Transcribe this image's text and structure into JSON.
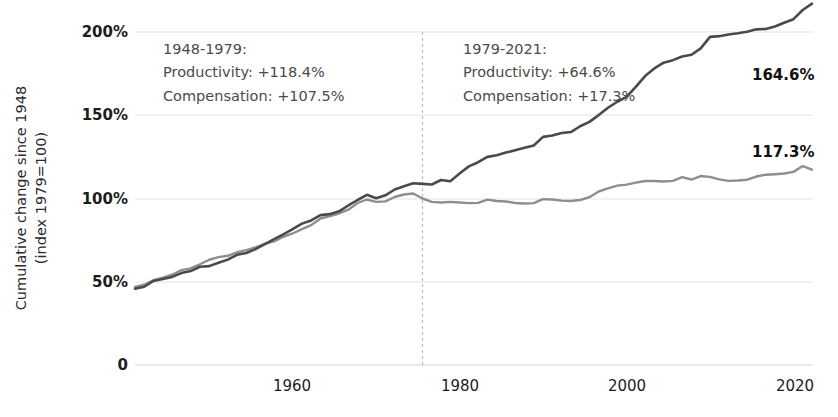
{
  "chart_data": {
    "type": "line",
    "title": "",
    "xlabel": "",
    "ylabel": "Cumulative change since 1948",
    "ylabel_sub": "(index 1979=100)",
    "xlim": [
      1948,
      2021
    ],
    "ylim": [
      0,
      200
    ],
    "grid": true,
    "legend_position": "none",
    "ytick_labels": [
      "200%",
      "150%",
      "100%",
      "50%",
      "0"
    ],
    "ytick_values": [
      200,
      150,
      100,
      50,
      0
    ],
    "xtick_labels": [
      "1960",
      "1980",
      "2000",
      "2020"
    ],
    "xtick_values": [
      1960,
      1980,
      2000,
      2020
    ],
    "reference_line": {
      "x": 1979,
      "style": "dashed",
      "color": "#bbbbbb"
    },
    "series": [
      {
        "name": "Productivity",
        "color": "#4a4a4a",
        "end_label": "164.6%",
        "end_value": 164.6,
        "x": [
          1948,
          1949,
          1950,
          1951,
          1952,
          1953,
          1954,
          1955,
          1956,
          1957,
          1958,
          1959,
          1960,
          1961,
          1962,
          1963,
          1964,
          1965,
          1966,
          1967,
          1968,
          1969,
          1970,
          1971,
          1972,
          1973,
          1974,
          1975,
          1976,
          1977,
          1978,
          1979,
          1980,
          1981,
          1982,
          1983,
          1984,
          1985,
          1986,
          1987,
          1988,
          1989,
          1990,
          1991,
          1992,
          1993,
          1994,
          1995,
          1996,
          1997,
          1998,
          1999,
          2000,
          2001,
          2002,
          2003,
          2004,
          2005,
          2006,
          2007,
          2008,
          2009,
          2010,
          2011,
          2012,
          2013,
          2014,
          2015,
          2016,
          2017,
          2018,
          2019,
          2020,
          2021
        ],
        "values": [
          45.8,
          47.0,
          50.5,
          51.6,
          52.9,
          55.2,
          56.4,
          59.0,
          59.4,
          61.4,
          63.3,
          66.2,
          67.3,
          69.6,
          72.6,
          75.6,
          78.5,
          81.6,
          84.9,
          86.8,
          90.0,
          90.6,
          92.3,
          95.8,
          99.1,
          102.2,
          100.1,
          101.9,
          105.4,
          107.4,
          109.2,
          108.8,
          108.4,
          111.1,
          110.4,
          115.0,
          119.3,
          121.8,
          125.0,
          126.0,
          127.6,
          129.0,
          130.5,
          131.8,
          137.0,
          137.8,
          139.3,
          139.9,
          143.4,
          146.0,
          150.1,
          154.5,
          158.1,
          161.0,
          167.0,
          173.5,
          178.1,
          181.6,
          183.1,
          185.3,
          186.3,
          190.2,
          197.1,
          197.5,
          198.5,
          199.2,
          200.1,
          201.6,
          201.8,
          203.3,
          205.6,
          207.7,
          213.2,
          217.0
        ]
      },
      {
        "name": "Compensation",
        "color": "#8e8e8e",
        "end_label": "117.3%",
        "end_value": 117.3,
        "x": [
          1948,
          1949,
          1950,
          1951,
          1952,
          1953,
          1954,
          1955,
          1956,
          1957,
          1958,
          1959,
          1960,
          1961,
          1962,
          1963,
          1964,
          1965,
          1966,
          1967,
          1968,
          1969,
          1970,
          1971,
          1972,
          1973,
          1974,
          1975,
          1976,
          1977,
          1978,
          1979,
          1980,
          1981,
          1982,
          1983,
          1984,
          1985,
          1986,
          1987,
          1988,
          1989,
          1990,
          1991,
          1992,
          1993,
          1994,
          1995,
          1996,
          1997,
          1998,
          1999,
          2000,
          2001,
          2002,
          2003,
          2004,
          2005,
          2006,
          2007,
          2008,
          2009,
          2010,
          2011,
          2012,
          2013,
          2014,
          2015,
          2016,
          2017,
          2018,
          2019,
          2020,
          2021
        ],
        "values": [
          46.9,
          48.2,
          51.0,
          52.5,
          54.2,
          57.0,
          58.0,
          60.5,
          63.2,
          64.8,
          65.6,
          67.7,
          69.0,
          70.6,
          72.7,
          74.2,
          77.0,
          79.0,
          81.6,
          84.0,
          88.0,
          89.4,
          91.0,
          93.3,
          97.3,
          99.4,
          98.0,
          98.3,
          100.9,
          102.4,
          103.0,
          100.0,
          98.0,
          97.6,
          98.0,
          97.6,
          97.2,
          97.4,
          99.3,
          98.5,
          98.2,
          97.3,
          97.0,
          97.2,
          99.6,
          99.4,
          98.7,
          98.5,
          99.1,
          100.8,
          104.2,
          106.1,
          107.7,
          108.3,
          109.5,
          110.5,
          110.5,
          110.2,
          110.6,
          112.8,
          111.4,
          113.5,
          113.0,
          111.5,
          110.6,
          110.8,
          111.3,
          113.2,
          114.3,
          114.6,
          115.0,
          116.0,
          119.5,
          117.3
        ]
      }
    ],
    "annotations": [
      {
        "id": "period-1948-1979",
        "lines": [
          "1948-1979:",
          "Productivity: +118.4%",
          "Compensation: +107.5%"
        ],
        "period": "1948-1979",
        "productivity_change": "+118.4%",
        "compensation_change": "+107.5%"
      },
      {
        "id": "period-1979-2021",
        "lines": [
          "1979-2021:",
          "Productivity: +64.6%",
          "Compensation: +17.3%"
        ],
        "period": "1979-2021",
        "productivity_change": "+64.6%",
        "compensation_change": "+17.3%"
      }
    ]
  }
}
